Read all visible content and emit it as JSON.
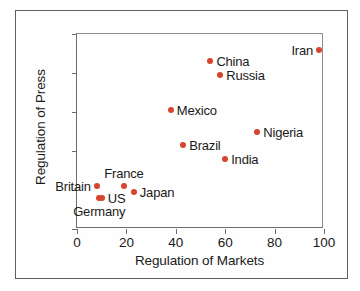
{
  "chart_data": {
    "type": "scatter",
    "title": "",
    "xlabel": "Regulation of Markets",
    "ylabel": "Regulation of Press",
    "xlim": [
      0,
      100
    ],
    "ylim": [
      0,
      100
    ],
    "xticks": [
      "0",
      "20",
      "40",
      "60",
      "80",
      "100"
    ],
    "yticks": [
      "0",
      "20",
      "40",
      "60",
      "80",
      "100"
    ],
    "grid": false,
    "legend": "none",
    "marker_color": "#d6442b",
    "points": [
      {
        "label": "Iran",
        "x": 98,
        "y": 92,
        "label_pos": "left"
      },
      {
        "label": "China",
        "x": 54,
        "y": 86,
        "label_pos": "right"
      },
      {
        "label": "Russia",
        "x": 58,
        "y": 79,
        "label_pos": "right"
      },
      {
        "label": "Mexico",
        "x": 38,
        "y": 61,
        "label_pos": "right"
      },
      {
        "label": "Nigeria",
        "x": 73,
        "y": 50,
        "label_pos": "right"
      },
      {
        "label": "Brazil",
        "x": 43,
        "y": 43,
        "label_pos": "right"
      },
      {
        "label": "India",
        "x": 60,
        "y": 36,
        "label_pos": "right"
      },
      {
        "label": "France",
        "x": 19,
        "y": 22,
        "label_pos": "top"
      },
      {
        "label": "Britain",
        "x": 8,
        "y": 22,
        "label_pos": "left"
      },
      {
        "label": "Japan",
        "x": 23,
        "y": 19,
        "label_pos": "right"
      },
      {
        "label": "US",
        "x": 10,
        "y": 16,
        "label_pos": "right"
      },
      {
        "label": "Germany",
        "x": 9,
        "y": 16,
        "label_pos": "bottom"
      }
    ]
  }
}
